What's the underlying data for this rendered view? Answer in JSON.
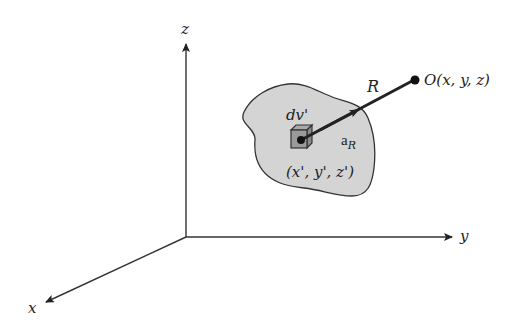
{
  "diagram": {
    "axes": {
      "x_label": "x",
      "y_label": "y",
      "z_label": "z"
    },
    "volume_element_label": "dv'",
    "source_point_label": "(x', y', z')",
    "distance_label": "R",
    "unit_vector_label_main": "a",
    "unit_vector_label_sub": "R",
    "field_point_label": "O(x, y, z)",
    "colors": {
      "region_fill": "#d4d4d4",
      "line": "#222222",
      "background": "#ffffff"
    }
  }
}
